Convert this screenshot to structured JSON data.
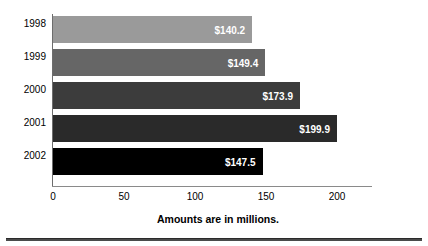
{
  "chart_data": {
    "type": "bar",
    "orientation": "horizontal",
    "title": "",
    "xlabel": "",
    "ylabel": "",
    "caption": "Amounts are in millions.",
    "categories": [
      "1998",
      "1999",
      "2000",
      "2001",
      "2002"
    ],
    "values": [
      140.2,
      149.4,
      173.9,
      199.9,
      147.5
    ],
    "data_labels": [
      "$140.2",
      "$149.4",
      "$173.9",
      "$199.9",
      "$147.5"
    ],
    "xlim": [
      0,
      210
    ],
    "xticks": [
      0,
      50,
      100,
      150,
      200
    ],
    "xtick_labels": [
      "0",
      "50",
      "100",
      "150",
      "200"
    ],
    "grid": false,
    "legend": "none",
    "bar_colors": [
      "#9a9a9a",
      "#666666",
      "#3c3c3c",
      "#2a2a2a",
      "#000000"
    ],
    "label_color": "#ffffff",
    "axis_color": "#6d6d6d"
  }
}
